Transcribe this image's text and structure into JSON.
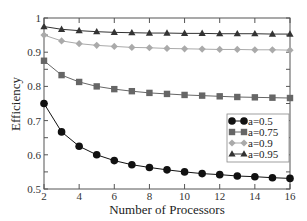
{
  "chart_data": {
    "type": "line",
    "title": "",
    "xlabel": "Number of Processors",
    "ylabel": "Efficiency",
    "xlim": [
      2,
      16
    ],
    "ylim": [
      0.5,
      1.0
    ],
    "grid": false,
    "legend_position": "right-middle",
    "x": [
      2,
      3,
      4,
      5,
      6,
      7,
      8,
      9,
      10,
      11,
      12,
      13,
      14,
      15,
      16
    ],
    "x_ticks": [
      2,
      4,
      6,
      8,
      10,
      12,
      14,
      16
    ],
    "x_tick_labels": [
      "2",
      "4",
      "6",
      "8",
      "10",
      "12",
      "14",
      "16"
    ],
    "y_ticks": [
      0.5,
      0.6,
      0.7,
      0.8,
      0.9,
      1.0
    ],
    "y_tick_labels": [
      "0.5",
      "0.6",
      "0.7",
      "0.8",
      "0.9",
      "1"
    ],
    "series": [
      {
        "name": "a=0.5",
        "marker": "circle",
        "color": "#111111",
        "values": [
          0.75,
          0.667,
          0.625,
          0.6,
          0.583,
          0.571,
          0.563,
          0.556,
          0.55,
          0.545,
          0.542,
          0.538,
          0.536,
          0.533,
          0.531
        ]
      },
      {
        "name": "a=0.75",
        "marker": "square",
        "color": "#666666",
        "values": [
          0.875,
          0.833,
          0.813,
          0.8,
          0.792,
          0.786,
          0.781,
          0.778,
          0.775,
          0.773,
          0.771,
          0.769,
          0.768,
          0.767,
          0.766
        ]
      },
      {
        "name": "a=0.9",
        "marker": "diamond",
        "color": "#aaaaaa",
        "values": [
          0.95,
          0.933,
          0.925,
          0.92,
          0.917,
          0.914,
          0.913,
          0.911,
          0.91,
          0.909,
          0.908,
          0.908,
          0.907,
          0.907,
          0.906
        ]
      },
      {
        "name": "a=0.95",
        "marker": "triangle",
        "color": "#333333",
        "values": [
          0.975,
          0.967,
          0.963,
          0.96,
          0.958,
          0.957,
          0.956,
          0.956,
          0.955,
          0.955,
          0.954,
          0.954,
          0.954,
          0.953,
          0.953
        ]
      }
    ]
  }
}
